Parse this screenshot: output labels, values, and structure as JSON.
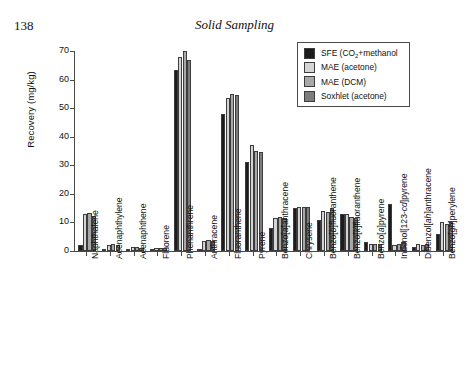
{
  "page": {
    "number": "138",
    "running_head": "Solid Sampling"
  },
  "legend": {
    "position": "top-right-inside",
    "entries": [
      {
        "label_pre": "SFE (CO",
        "label_sub": "2",
        "label_post": "+methanol",
        "label": "SFE (CO2+methanol",
        "color": "#1c1c1c"
      },
      {
        "label": "MAE (acetone)",
        "color": "#d4d4d4"
      },
      {
        "label": "MAE (DCM)",
        "color": "#a8a8a8"
      },
      {
        "label": "Soxhlet (acetone)",
        "color": "#7d7d7d"
      }
    ]
  },
  "chart_data": {
    "type": "bar",
    "title": "",
    "xlabel": "",
    "ylabel": "Recovery (mg/kg)",
    "ylim": [
      0,
      70
    ],
    "yticks": [
      0,
      10,
      20,
      30,
      40,
      50,
      60,
      70
    ],
    "grid": false,
    "categories": [
      "Naphthalene",
      "Acenaphthylene",
      "Acenaphthene",
      "Fluorene",
      "Phenanthrene",
      "Anthracene",
      "Fluoranthene",
      "Pyrene",
      "Benzo[a]anthracene",
      "Chrysene",
      "Benzo[b]fluoranthene",
      "Benzo[k]fluoranthene",
      "Benzo[a]pyrene",
      "Indenol[123-cd]pyrene",
      "Dibenzol[ah]anthracene",
      "Benzo[gh]perylene"
    ],
    "categories_markup": [
      "Naphthalene",
      "Acenaphthylene",
      "Acenaphthene",
      "Fluorene",
      "Phenanthrene",
      "Anthracene",
      "Fluoranthene",
      "Pyrene",
      "Benzo[<i>a</i>]anthracene",
      "Chrysene",
      "Benzo[<i>b</i>]fluoranthene",
      "Benzo[<i>k</i>]fluoranthene",
      "Benzo[<i>a</i>]pyrene",
      "Indenol[123-<i>cd</i>]pyrene",
      "Dibenzol[<i>ah</i>]anthracene",
      "Benzo[<i>gh</i>]perylene"
    ],
    "series": [
      {
        "name": "SFE (CO2+methanol)",
        "color": "#1c1c1c",
        "values": [
          2.0,
          0.6,
          0.6,
          0.5,
          63.5,
          0.5,
          48.0,
          31.0,
          8.0,
          15.0,
          11.0,
          13.0,
          3.0,
          16.5,
          1.5,
          6.0
        ]
      },
      {
        "name": "MAE (acetone)",
        "color": "#d4d4d4",
        "values": [
          12.8,
          2.2,
          1.3,
          1.0,
          68.0,
          3.6,
          53.5,
          37.0,
          11.5,
          15.5,
          14.0,
          13.0,
          2.6,
          2.0,
          2.5,
          10.0
        ]
      },
      {
        "name": "MAE (DCM)",
        "color": "#a8a8a8",
        "values": [
          13.3,
          2.6,
          1.3,
          1.0,
          70.0,
          3.8,
          55.0,
          35.0,
          12.0,
          15.5,
          13.5,
          12.0,
          2.5,
          2.5,
          2.0,
          9.5
        ]
      },
      {
        "name": "Soxhlet (acetone)",
        "color": "#7d7d7d",
        "values": [
          12.3,
          2.0,
          1.2,
          1.0,
          67.0,
          3.5,
          54.5,
          34.5,
          11.5,
          15.5,
          15.0,
          11.5,
          2.5,
          3.0,
          2.5,
          10.0
        ]
      }
    ]
  }
}
